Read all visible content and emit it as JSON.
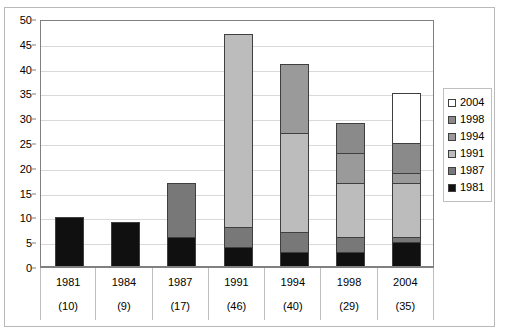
{
  "chart_data": {
    "type": "bar",
    "stacked": true,
    "orientation": "vertical",
    "title": "",
    "subtitle": "",
    "xlabel": "",
    "ylabel": "",
    "ylim": [
      0,
      50
    ],
    "ytick_step": 5,
    "yticks": [
      0,
      5,
      10,
      15,
      20,
      25,
      30,
      35,
      40,
      45,
      50
    ],
    "ytick_labels": [
      "0",
      "5",
      "10",
      "15",
      "20",
      "25",
      "30",
      "35",
      "40",
      "45",
      "50"
    ],
    "grid": "horizontal",
    "legend_position": "right",
    "categories": [
      "1981",
      "1984",
      "1987",
      "1991",
      "1994",
      "1998",
      "2004"
    ],
    "category_sublabels": [
      "(10)",
      "(9)",
      "(17)",
      "(46)",
      "(40)",
      "(29)",
      "(35)"
    ],
    "category_totals": [
      10,
      9,
      17,
      47,
      41,
      29,
      35
    ],
    "series": [
      {
        "name": "1981",
        "color": "#101010",
        "values": [
          10,
          9,
          6,
          4,
          3,
          3,
          5
        ]
      },
      {
        "name": "1987",
        "color": "#787878",
        "values": [
          0,
          0,
          11,
          4,
          4,
          3,
          1
        ]
      },
      {
        "name": "1991",
        "color": "#bcbcbc",
        "values": [
          0,
          0,
          0,
          39,
          20,
          11,
          11
        ]
      },
      {
        "name": "1994",
        "color": "#9a9a9a",
        "values": [
          0,
          0,
          0,
          0,
          14,
          6,
          2
        ]
      },
      {
        "name": "1998",
        "color": "#8a8a8a",
        "values": [
          0,
          0,
          0,
          0,
          0,
          6,
          6
        ]
      },
      {
        "name": "2004",
        "color": "#ffffff",
        "values": [
          0,
          0,
          0,
          0,
          0,
          0,
          10
        ]
      }
    ],
    "legend_entries": [
      {
        "label": "2004",
        "color": "#ffffff"
      },
      {
        "label": "1998",
        "color": "#8a8a8a"
      },
      {
        "label": "1994",
        "color": "#9a9a9a"
      },
      {
        "label": "1991",
        "color": "#bcbcbc"
      },
      {
        "label": "1987",
        "color": "#787878"
      },
      {
        "label": "1981",
        "color": "#101010"
      }
    ]
  },
  "style": {
    "plot_border_color": "#808080",
    "gridline_color": "#d9d9d9",
    "bar_outline_color": "#3f3f3f",
    "outer_frame_color": "#b9b9b9",
    "table_divider_color": "#bfbfbf",
    "background": "#ffffff"
  }
}
